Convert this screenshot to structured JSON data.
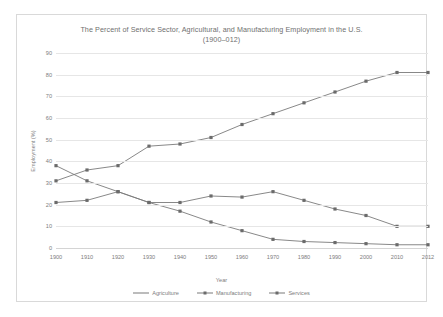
{
  "chart_data": {
    "type": "line",
    "title": "The Percent of Service Sector, Agricultural, and Manufacturing Employment in the U.S.",
    "subtitle": "(1900–012)",
    "xlabel": "Year",
    "ylabel": "Employment (%)",
    "categories": [
      "1900",
      "1910",
      "1920",
      "1930",
      "1940",
      "1950",
      "1960",
      "1970",
      "1980",
      "1990",
      "2000",
      "2010",
      "2012"
    ],
    "ylim": [
      0,
      90
    ],
    "ytick_step": 10,
    "yticks": [
      "90",
      "80",
      "70",
      "60",
      "50",
      "40",
      "30",
      "20",
      "10",
      "0"
    ],
    "grid": "horizontal",
    "legend_position": "bottom-center",
    "series": [
      {
        "name": "Agriculture",
        "color": "#7a7a7a",
        "marker": "square",
        "values": [
          38,
          31,
          26,
          21,
          17,
          12,
          8,
          4,
          3,
          2.5,
          2,
          1.5,
          1.5
        ]
      },
      {
        "name": "Manufacturing",
        "color": "#7a7a7a",
        "marker": "square",
        "values": [
          21,
          22,
          26,
          21,
          21,
          24,
          23.5,
          26,
          22,
          18,
          15,
          10,
          10
        ]
      },
      {
        "name": "Services",
        "color": "#7a7a7a",
        "marker": "square",
        "values": [
          31,
          36,
          38,
          47,
          48,
          51,
          57,
          62,
          67,
          72,
          77,
          81,
          81
        ]
      }
    ]
  }
}
